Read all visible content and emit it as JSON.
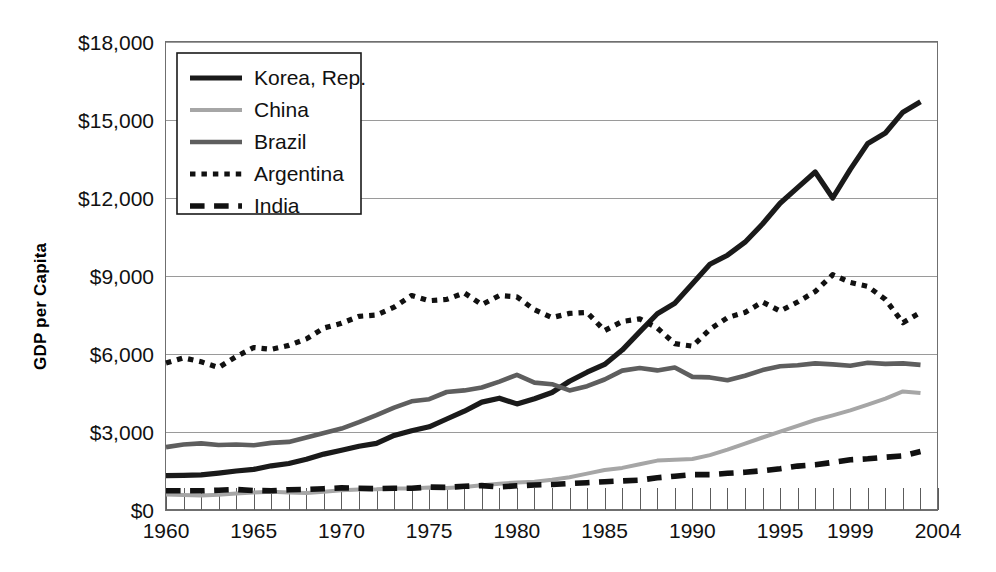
{
  "chart_data": {
    "type": "line",
    "title": "",
    "xlabel": "",
    "ylabel": "GDP per Capita",
    "xlim": [
      1960,
      2004
    ],
    "ylim": [
      0,
      18000
    ],
    "grid": true,
    "legend_position": "top-left-inside",
    "y_ticks": [
      0,
      3000,
      6000,
      9000,
      12000,
      15000,
      18000
    ],
    "y_tick_labels": [
      "$0",
      "$3,000",
      "$6,000",
      "$9,000",
      "$12,000",
      "$15,000",
      "$18,000"
    ],
    "x_ticks": [
      1960,
      1965,
      1970,
      1975,
      1980,
      1985,
      1990,
      1995,
      1999,
      2004
    ],
    "x_tick_labels": [
      "1960",
      "1965",
      "1970",
      "1975",
      "1980",
      "1985",
      "1990",
      "1995",
      "1999",
      "2004"
    ],
    "x_minor_tick_step": 1,
    "x": [
      1960,
      1961,
      1962,
      1963,
      1964,
      1965,
      1966,
      1967,
      1968,
      1969,
      1970,
      1971,
      1972,
      1973,
      1974,
      1975,
      1976,
      1977,
      1978,
      1979,
      1980,
      1981,
      1982,
      1983,
      1984,
      1985,
      1986,
      1987,
      1988,
      1989,
      1990,
      1991,
      1992,
      1993,
      1994,
      1995,
      1996,
      1997,
      1998,
      1999,
      2000,
      2001,
      2002,
      2003
    ],
    "series": [
      {
        "name": "Korea, Rep.",
        "color": "#1a1a1a",
        "style": "solid",
        "width": 5.2,
        "values": [
          1320,
          1330,
          1350,
          1420,
          1500,
          1560,
          1700,
          1790,
          1950,
          2150,
          2300,
          2450,
          2560,
          2870,
          3050,
          3200,
          3500,
          3800,
          4150,
          4300,
          4080,
          4280,
          4520,
          4950,
          5300,
          5600,
          6150,
          6850,
          7550,
          7950,
          8700,
          9450,
          9800,
          10300,
          11000,
          11800,
          12400,
          13000,
          12000,
          13100,
          14100,
          14500,
          15300,
          15700
        ]
      },
      {
        "name": "China",
        "color": "#a6a6a6",
        "style": "solid",
        "width": 4.0,
        "values": [
          600,
          580,
          560,
          590,
          640,
          670,
          700,
          670,
          650,
          700,
          760,
          790,
          800,
          830,
          830,
          870,
          850,
          880,
          950,
          1010,
          1060,
          1090,
          1160,
          1260,
          1400,
          1540,
          1620,
          1760,
          1900,
          1930,
          1960,
          2110,
          2320,
          2550,
          2790,
          3010,
          3240,
          3460,
          3640,
          3830,
          4050,
          4280,
          4560,
          4500
        ]
      },
      {
        "name": "Brazil",
        "color": "#5e5e5e",
        "style": "solid",
        "width": 4.6,
        "values": [
          2420,
          2520,
          2560,
          2500,
          2520,
          2490,
          2580,
          2620,
          2790,
          2960,
          3130,
          3380,
          3650,
          3940,
          4180,
          4260,
          4540,
          4600,
          4710,
          4940,
          5200,
          4900,
          4840,
          4600,
          4760,
          5020,
          5360,
          5460,
          5370,
          5480,
          5120,
          5100,
          4990,
          5160,
          5380,
          5530,
          5570,
          5640,
          5600,
          5550,
          5660,
          5620,
          5640,
          5580
        ]
      },
      {
        "name": "Argentina",
        "color": "#111111",
        "style": "dotted",
        "width": 5.2,
        "values": [
          5650,
          5850,
          5700,
          5480,
          5900,
          6250,
          6180,
          6330,
          6580,
          7000,
          7180,
          7450,
          7500,
          7800,
          8250,
          8050,
          8100,
          8350,
          7900,
          8250,
          8200,
          7700,
          7400,
          7560,
          7600,
          6900,
          7250,
          7350,
          7000,
          6400,
          6300,
          6950,
          7400,
          7600,
          8000,
          7650,
          8000,
          8400,
          9050,
          8750,
          8600,
          8100,
          7200,
          7600
        ]
      },
      {
        "name": "India",
        "color": "#111111",
        "style": "dashed",
        "width": 5.6,
        "values": [
          740,
          740,
          740,
          760,
          790,
          750,
          740,
          780,
          790,
          820,
          850,
          840,
          820,
          840,
          840,
          880,
          870,
          910,
          940,
          890,
          930,
          960,
          980,
          1020,
          1050,
          1090,
          1120,
          1150,
          1240,
          1300,
          1360,
          1360,
          1410,
          1450,
          1510,
          1590,
          1690,
          1740,
          1830,
          1930,
          1970,
          2030,
          2080,
          2250
        ]
      }
    ]
  },
  "legend": {
    "entries": [
      {
        "label": "Korea, Rep."
      },
      {
        "label": "China"
      },
      {
        "label": "Brazil"
      },
      {
        "label": "Argentina"
      },
      {
        "label": "India"
      }
    ]
  }
}
